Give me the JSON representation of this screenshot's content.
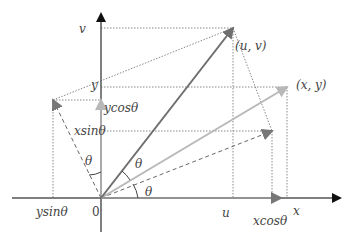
{
  "diagram": {
    "colors": {
      "axis": "#555555",
      "axis_arrow": "#111111",
      "vector_uv": "#6e6e6e",
      "vector_xy": "#b8b8b8",
      "dashed": "#666666",
      "dotted": "#888888",
      "label": "#444444"
    },
    "labels": {
      "v_axis": "v",
      "y_axis_mark": "y",
      "ycos": "ycos",
      "xsin": "xsin",
      "ysin": "ysin",
      "origin": "0",
      "u_mark": "u",
      "xcos": "xcos",
      "x_axis": "x",
      "point_uv": "(u,  v)",
      "point_xy": "(x,  y)",
      "theta": "θ",
      "theta_angle_vertical": "θ",
      "theta_angle_between": "θ",
      "theta_angle_horizontal": "θ"
    },
    "points": {
      "origin": [
        101,
        198
      ],
      "uv": [
        233,
        28
      ],
      "xy": [
        287,
        87
      ],
      "xcos_tip": [
        281,
        198
      ],
      "ycos_tip": [
        101,
        100
      ],
      "rot_x": [
        272,
        131
      ],
      "rot_y": [
        53,
        100
      ]
    }
  }
}
